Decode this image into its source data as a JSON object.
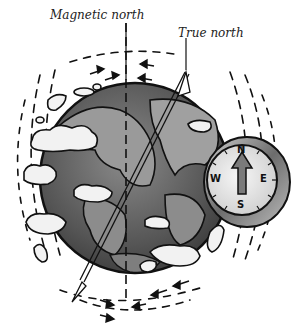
{
  "labels": {
    "magnetic_north": "Magnetic north",
    "true_north": "True north"
  },
  "compass": {
    "n": "N",
    "e": "E",
    "s": "S",
    "w": "W"
  },
  "colors": {
    "globe_ocean": "#5a5a5a",
    "globe_land": "#9a9a9a",
    "outline": "#111111",
    "cloud": "#f2f2f2",
    "compass_rim": "#8a8a8a",
    "compass_face": "#e8e8e8",
    "arrow": "#7a7a7a"
  }
}
